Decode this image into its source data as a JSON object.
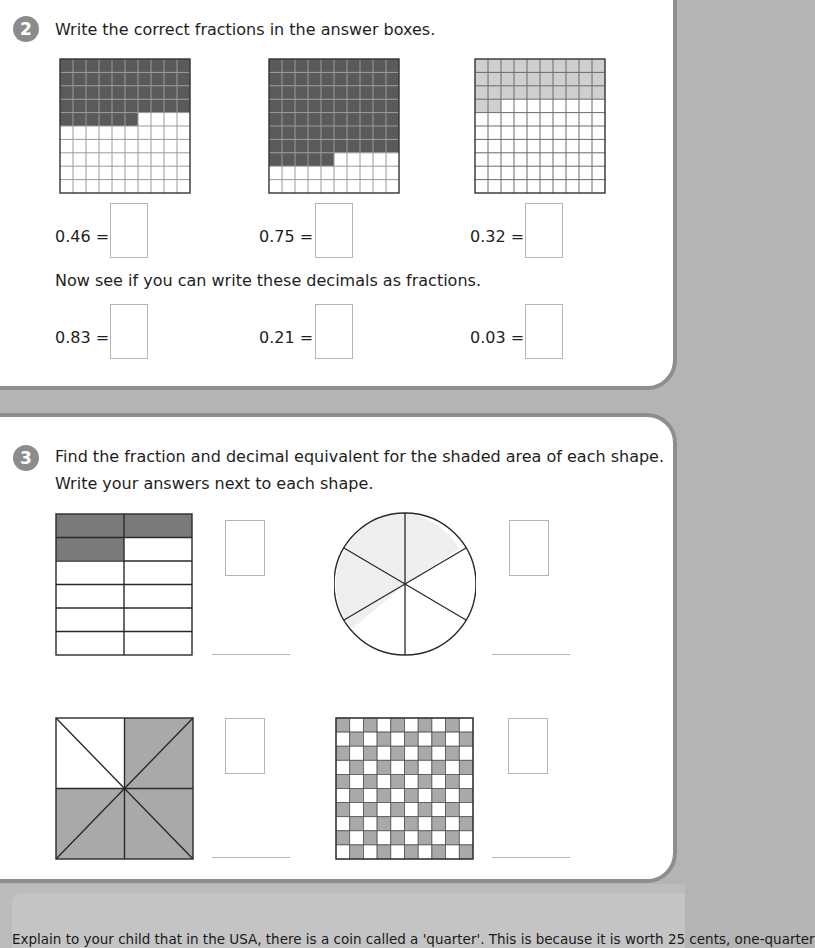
{
  "section2": {
    "number": "2",
    "instruction": "Write the correct fractions in the answer boxes.",
    "grids": [
      {
        "label": "0.46 =",
        "shaded": 46,
        "shade_color": "#5a5a5a",
        "line_color": "#9a9a9a"
      },
      {
        "label": "0.75 =",
        "shaded": 75,
        "shade_color": "#5a5a5a",
        "line_color": "#9a9a9a"
      },
      {
        "label": "0.32 =",
        "shaded": 32,
        "shade_color": "#cfcfcf",
        "line_color": "#6a6a6a"
      }
    ],
    "sub_instruction": "Now see if you can write these decimals as fractions.",
    "decimals": [
      {
        "label": "0.83 ="
      },
      {
        "label": "0.21 ="
      },
      {
        "label": "0.03 ="
      }
    ]
  },
  "section3": {
    "number": "3",
    "instruction_line1": "Find the fraction and decimal equivalent for the shaded area of each shape.",
    "instruction_line2": "Write your answers next to each shape.",
    "shapes": [
      {
        "type": "rectangle-grid",
        "rows": 6,
        "cols": 2,
        "shaded_cells": 3
      },
      {
        "type": "circle",
        "sectors": 6,
        "shaded_sectors": 3
      },
      {
        "type": "square-8-triangles",
        "sectors": 8,
        "shaded_sectors": 6
      },
      {
        "type": "checkerboard",
        "rows": 10,
        "cols": 10,
        "shaded_cells": 50
      }
    ]
  },
  "footer": {
    "text": "Explain to your child that in the USA, there is a coin called a 'quarter'. This is because it is worth 25 cents, one-quarter"
  },
  "colors": {
    "panel_border": "#8e8e8e",
    "background": "#b4b4b4",
    "badge": "#8c8c8c",
    "dark_shade": "#5a5a5a",
    "mid_shade": "#a9a9a9",
    "light_shade": "#cfcfcf"
  }
}
